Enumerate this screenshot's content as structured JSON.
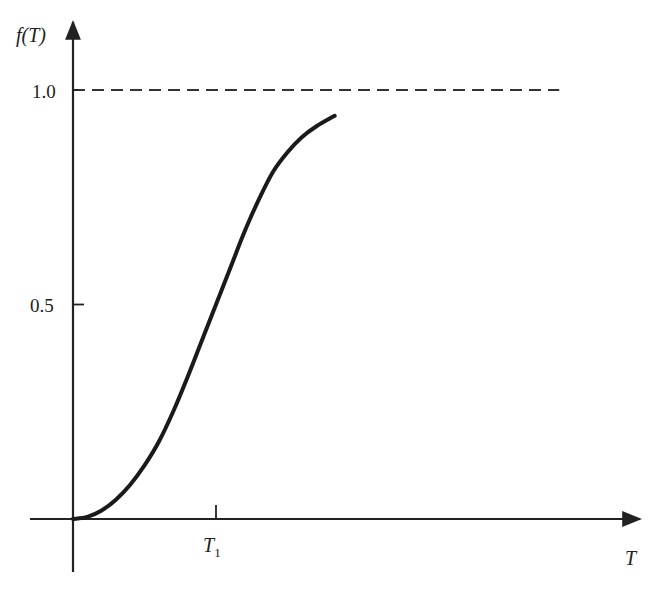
{
  "chart_data": {
    "type": "line",
    "title": "",
    "xlabel": "T",
    "ylabel": "f(T)",
    "x_ticks": [
      {
        "value": 1.0,
        "label": "T",
        "sub": "1"
      }
    ],
    "y_ticks": [
      {
        "value": 0.5,
        "label": "0.5"
      },
      {
        "value": 1.0,
        "label": "1.0"
      }
    ],
    "xlim": [
      -0.2,
      4.0
    ],
    "ylim": [
      -0.18,
      1.15
    ],
    "asymptote": {
      "y": 1.0,
      "style": "dashed",
      "x_end": 3.4
    },
    "grid": false,
    "legend": null,
    "series": [
      {
        "name": "f(T)",
        "description": "sigmoid cumulative curve starting at origin, inflection near T1 at f=0.5, approaching 1.0",
        "x": [
          0.0,
          0.1,
          0.2,
          0.3,
          0.4,
          0.5,
          0.6,
          0.7,
          0.8,
          0.9,
          1.0,
          1.1,
          1.2,
          1.3,
          1.4,
          1.5,
          1.6,
          1.7,
          1.83
        ],
        "y": [
          0.0,
          0.005,
          0.02,
          0.045,
          0.08,
          0.125,
          0.18,
          0.25,
          0.33,
          0.415,
          0.5,
          0.585,
          0.67,
          0.745,
          0.81,
          0.855,
          0.89,
          0.915,
          0.94
        ]
      }
    ]
  },
  "labels": {
    "y_axis": "f(T)",
    "x_axis": "T",
    "t1_main": "T",
    "t1_sub": "1",
    "tick_1_0": "1.0",
    "tick_0_5": "0.5"
  }
}
